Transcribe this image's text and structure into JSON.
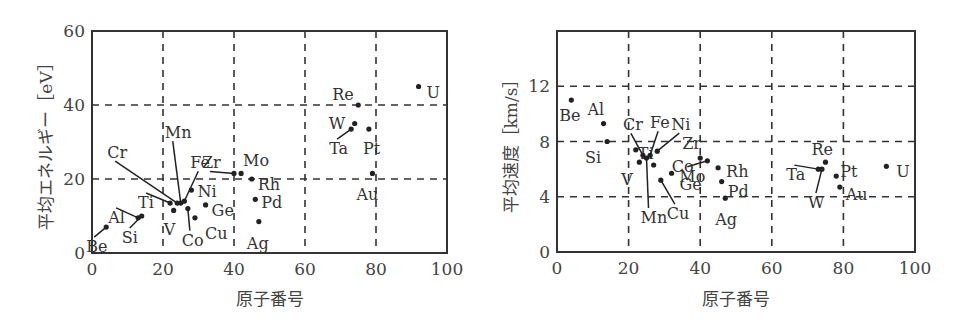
{
  "chart_data": [
    {
      "type": "scatter",
      "title": "",
      "xlabel": "原子番号",
      "ylabel": "平均エネルギー［eV］",
      "xlim": [
        0,
        100
      ],
      "ylim": [
        0,
        60
      ],
      "xticks": [
        0,
        20,
        40,
        60,
        80,
        100
      ],
      "yticks": [
        0,
        20,
        40,
        60
      ],
      "grid": true,
      "points": [
        {
          "label": "Be",
          "x": 4,
          "y": 7
        },
        {
          "label": "Al",
          "x": 13,
          "y": 9.5
        },
        {
          "label": "Si",
          "x": 14,
          "y": 10
        },
        {
          "label": "Ti",
          "x": 22,
          "y": 13.5
        },
        {
          "label": "V",
          "x": 23,
          "y": 11.5
        },
        {
          "label": "Cr",
          "x": 24,
          "y": 13.5
        },
        {
          "label": "Mn",
          "x": 25,
          "y": 13.5
        },
        {
          "label": "Fe",
          "x": 26,
          "y": 14
        },
        {
          "label": "Co",
          "x": 27,
          "y": 12
        },
        {
          "label": "Ni",
          "x": 28,
          "y": 17
        },
        {
          "label": "Cu",
          "x": 29,
          "y": 9.5
        },
        {
          "label": "Ge",
          "x": 32,
          "y": 13
        },
        {
          "label": "Zr",
          "x": 40,
          "y": 21.5
        },
        {
          "label": "Mo",
          "x": 42,
          "y": 21.5
        },
        {
          "label": "Rh",
          "x": 45,
          "y": 20
        },
        {
          "label": "Pd",
          "x": 46,
          "y": 14.5
        },
        {
          "label": "Ag",
          "x": 47,
          "y": 8.5
        },
        {
          "label": "Ta",
          "x": 73,
          "y": 33.5
        },
        {
          "label": "W",
          "x": 74,
          "y": 35
        },
        {
          "label": "Re",
          "x": 75,
          "y": 40
        },
        {
          "label": "Pt",
          "x": 78,
          "y": 33.5
        },
        {
          "label": "Au",
          "x": 79,
          "y": 21.5
        },
        {
          "label": "U",
          "x": 92,
          "y": 45
        }
      ]
    },
    {
      "type": "scatter",
      "title": "",
      "xlabel": "原子番号",
      "ylabel": "平均速度［km/s］",
      "xlim": [
        0,
        100
      ],
      "ylim": [
        0,
        16
      ],
      "xticks": [
        0,
        20,
        40,
        60,
        80,
        100
      ],
      "yticks": [
        0,
        4,
        8,
        12
      ],
      "grid": true,
      "points": [
        {
          "label": "Be",
          "x": 4,
          "y": 11
        },
        {
          "label": "Al",
          "x": 13,
          "y": 9.3
        },
        {
          "label": "Si",
          "x": 14,
          "y": 8
        },
        {
          "label": "Ti",
          "x": 22,
          "y": 7.4
        },
        {
          "label": "V",
          "x": 23,
          "y": 6.5
        },
        {
          "label": "Cr",
          "x": 24,
          "y": 7
        },
        {
          "label": "Mn",
          "x": 25,
          "y": 6.8
        },
        {
          "label": "Fe",
          "x": 26,
          "y": 7
        },
        {
          "label": "Co",
          "x": 27,
          "y": 6.3
        },
        {
          "label": "Ni",
          "x": 28,
          "y": 7.3
        },
        {
          "label": "Cu",
          "x": 29,
          "y": 5.2
        },
        {
          "label": "Ge",
          "x": 32,
          "y": 5.7
        },
        {
          "label": "Zr",
          "x": 40,
          "y": 6.8
        },
        {
          "label": "Mo",
          "x": 42,
          "y": 6.6
        },
        {
          "label": "Rh",
          "x": 45,
          "y": 6.1
        },
        {
          "label": "Pd",
          "x": 46,
          "y": 5.1
        },
        {
          "label": "Ag",
          "x": 47,
          "y": 3.9
        },
        {
          "label": "Ta",
          "x": 73,
          "y": 6
        },
        {
          "label": "W",
          "x": 74,
          "y": 6
        },
        {
          "label": "Re",
          "x": 75,
          "y": 6.5
        },
        {
          "label": "Pt",
          "x": 78,
          "y": 5.5
        },
        {
          "label": "Au",
          "x": 79,
          "y": 4.7
        },
        {
          "label": "U",
          "x": 92,
          "y": 6.2
        }
      ]
    }
  ],
  "layout": [
    {
      "x0": 92,
      "x1": 447,
      "y0": 253,
      "y1": 31
    },
    {
      "x0": 557,
      "x1": 915,
      "y0": 252,
      "y1": 31
    }
  ],
  "labels": [
    {
      "Be": [
        -20,
        20
      ],
      "Al": [
        -30,
        0
      ],
      "Si": [
        -20,
        22
      ],
      "Ti": [
        -32,
        0
      ],
      "V": [
        -10,
        20
      ],
      "Cr": [
        -70,
        -50
      ],
      "Mn": [
        -16,
        -70
      ],
      "Fe": [
        6,
        -38
      ],
      "Co": [
        -6,
        32
      ],
      "Ni": [
        6,
        2
      ],
      "Cu": [
        10,
        16
      ],
      "Ge": [
        6,
        6
      ],
      "Zr": [
        -32,
        -10
      ],
      "Mo": [
        2,
        -12
      ],
      "Rh": [
        6,
        6
      ],
      "Pd": [
        6,
        4
      ],
      "Ag": [
        -12,
        22
      ],
      "Ta": [
        -22,
        20
      ],
      "W": [
        -26,
        0
      ],
      "Re": [
        -26,
        -10
      ],
      "Pt": [
        -6,
        20
      ],
      "Au": [
        -16,
        22
      ],
      "U": [
        8,
        6
      ]
    },
    {
      "Be": [
        -12,
        16
      ],
      "Al": [
        -16,
        -14
      ],
      "Si": [
        -22,
        16
      ],
      "Ti": [
        2,
        4
      ],
      "V": [
        -18,
        18
      ],
      "Cr": [
        -20,
        -30
      ],
      "Mn": [
        -6,
        60
      ],
      "Fe": [
        0,
        -32
      ],
      "Co": [
        18,
        2
      ],
      "Ni": [
        14,
        -26
      ],
      "Cu": [
        6,
        34
      ],
      "Ge": [
        8,
        12
      ],
      "Zr": [
        -18,
        -14
      ],
      "Mo": [
        -28,
        16
      ],
      "Rh": [
        8,
        4
      ],
      "Pd": [
        6,
        10
      ],
      "Ag": [
        -10,
        22
      ],
      "Ta": [
        -32,
        6
      ],
      "W": [
        -14,
        34
      ],
      "Re": [
        -14,
        -12
      ],
      "Pt": [
        4,
        -4
      ],
      "Au": [
        6,
        8
      ],
      "U": [
        10,
        6
      ]
    }
  ]
}
